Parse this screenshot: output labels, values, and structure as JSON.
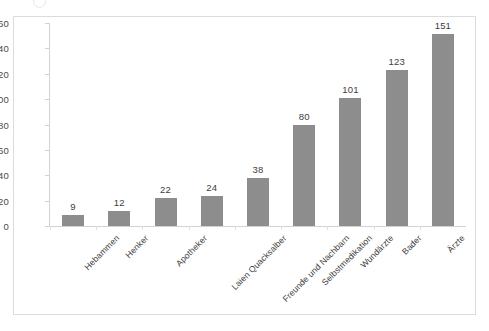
{
  "chart_data": {
    "type": "bar",
    "title": "",
    "subtitle": "",
    "xlabel": "",
    "ylabel": "",
    "categories": [
      "Hebammen",
      "Henker",
      "Apotheker",
      "Laien Quacksalber",
      "Freunde und Nachbarn",
      "Selbstmedikation",
      "Wundärzte",
      "Bader",
      "Ärzte"
    ],
    "values": [
      9,
      12,
      22,
      24,
      38,
      80,
      101,
      123,
      151
    ],
    "value_labels": [
      "9",
      "12",
      "22",
      "24",
      "38",
      "80",
      "101",
      "123",
      "151"
    ],
    "ylim": [
      0,
      160
    ],
    "ytick_labels": [
      "160",
      "140",
      "120",
      "100",
      "80",
      "60",
      "40",
      "20",
      "0"
    ],
    "ytick_values": [
      160,
      140,
      120,
      100,
      80,
      60,
      40,
      20,
      0
    ],
    "grid": false,
    "legend": false,
    "legend_position": "none",
    "bar_color": "#8d8d8d",
    "axis_color": "#d2d2d2",
    "frame_color": "#dcdcdc",
    "label_color": "#3d3d3d",
    "background": "#ffffff"
  }
}
